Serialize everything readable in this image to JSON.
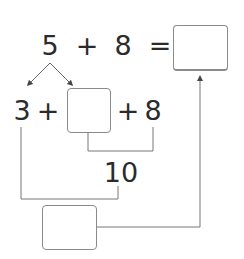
{
  "equation": {
    "top": {
      "addend1": "5",
      "plus": "+",
      "addend2": "8",
      "equals": "="
    },
    "decomposition": {
      "part1": "3",
      "plus1": "+",
      "plus2": "+",
      "addend": "8"
    },
    "make_ten": "10"
  },
  "answer_boxes": {
    "result": "",
    "decomposed_part": "",
    "remaining_sum": ""
  }
}
